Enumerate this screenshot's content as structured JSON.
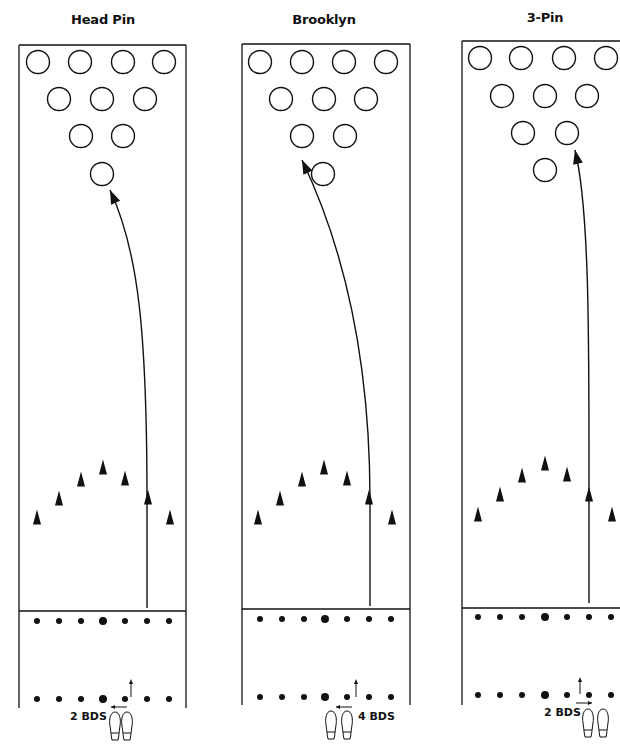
{
  "diagram": {
    "kind": "bowling-spare-targeting",
    "lanes": [
      {
        "id": "head-pin",
        "title": "Head Pin",
        "title_pos": {
          "x": 103,
          "y": 20
        },
        "box": {
          "left": 19,
          "right": 186,
          "top": 45,
          "foul": 611,
          "bottom": 708
        },
        "pins": [
          [
            38,
            62
          ],
          [
            80,
            62
          ],
          [
            123,
            62
          ],
          [
            164,
            62
          ],
          [
            59,
            99
          ],
          [
            102,
            99
          ],
          [
            145,
            99
          ],
          [
            81,
            136
          ],
          [
            123,
            136
          ],
          [
            102,
            174
          ]
        ],
        "arrows": [
          [
            37,
            517
          ],
          [
            59,
            498
          ],
          [
            81,
            479
          ],
          [
            103,
            467
          ],
          [
            125,
            478
          ],
          [
            148,
            497
          ],
          [
            170,
            517
          ]
        ],
        "ball_path": "M147 608 L147 500 C147 330 138 250 110 190",
        "arrow_triangle_on_path": [
          148,
          496
        ],
        "dots_top_y": 621,
        "dots_bottom_y": 699,
        "dots_x": [
          37,
          59,
          81,
          103,
          125,
          147,
          169
        ],
        "step_arrow": {
          "x1": 127,
          "x2": 111,
          "y": 707,
          "dir": "left"
        },
        "up_arrow": {
          "x": 131,
          "y1": 697,
          "y2": 679
        },
        "bds_label": "2 BDS",
        "bds_pos": {
          "x": 71,
          "y": 715
        },
        "feet_x": [
          115,
          127
        ],
        "feet_y": 712
      },
      {
        "id": "brooklyn",
        "title": "Brooklyn",
        "title_pos": {
          "x": 324,
          "y": 20
        },
        "box": {
          "left": 242,
          "right": 410,
          "top": 44,
          "foul": 609,
          "bottom": 705
        },
        "pins": [
          [
            260,
            62
          ],
          [
            302,
            62
          ],
          [
            344,
            62
          ],
          [
            386,
            62
          ],
          [
            281,
            99
          ],
          [
            324,
            99
          ],
          [
            366,
            99
          ],
          [
            302,
            136
          ],
          [
            345,
            136
          ],
          [
            323,
            174
          ]
        ],
        "arrows": [
          [
            258,
            517
          ],
          [
            280,
            498
          ],
          [
            302,
            479
          ],
          [
            324,
            467
          ],
          [
            347,
            478
          ],
          [
            369,
            497
          ],
          [
            392,
            517
          ]
        ],
        "ball_path": "M370 606 L370 500 C370 360 345 250 302 160",
        "arrow_triangle_on_path": [
          370,
          496
        ],
        "dots_top_y": 619,
        "dots_bottom_y": 697,
        "dots_x": [
          260,
          282,
          304,
          325,
          347,
          369,
          391
        ],
        "step_arrow": {
          "x1": 352,
          "x2": 336,
          "y": 707,
          "dir": "left"
        },
        "up_arrow": {
          "x": 356,
          "y1": 697,
          "y2": 679
        },
        "bds_label": "4 BDS",
        "bds_pos": {
          "x": 357,
          "y": 715
        },
        "feet_x": [
          331,
          347
        ],
        "feet_y": 711
      },
      {
        "id": "three-pin",
        "title": "3-Pin",
        "title_pos": {
          "x": 545,
          "y": 18
        },
        "box": {
          "left": 462,
          "right": 640,
          "top": 41,
          "foul": 608,
          "bottom": 705
        },
        "pins": [
          [
            480,
            58
          ],
          [
            521,
            58
          ],
          [
            564,
            58
          ],
          [
            606,
            58
          ],
          [
            502,
            96
          ],
          [
            545,
            96
          ],
          [
            587,
            96
          ],
          [
            523,
            133
          ],
          [
            567,
            133
          ],
          [
            545,
            170
          ]
        ],
        "arrows": [
          [
            478,
            514
          ],
          [
            500,
            494
          ],
          [
            522,
            475
          ],
          [
            545,
            463
          ],
          [
            567,
            474
          ],
          [
            589,
            494
          ],
          [
            612,
            514
          ]
        ],
        "ball_path": "M589 603 L589 500 C589 350 590 210 575 150",
        "arrow_triangle_on_path": [
          589,
          494
        ],
        "dots_top_y": 617,
        "dots_bottom_y": 695,
        "dots_x": [
          478,
          500,
          522,
          545,
          567,
          589,
          611
        ],
        "step_arrow": {
          "x1": 576,
          "x2": 592,
          "y": 703,
          "dir": "right"
        },
        "up_arrow": {
          "x": 580,
          "y1": 694,
          "y2": 677
        },
        "bds_label": "2 BDS",
        "bds_pos": {
          "x": 546,
          "y": 711
        },
        "feet_x": [
          588,
          603
        ],
        "feet_y": 709
      }
    ],
    "colors": {
      "ink": "#111111",
      "background": "#ffffff"
    }
  }
}
